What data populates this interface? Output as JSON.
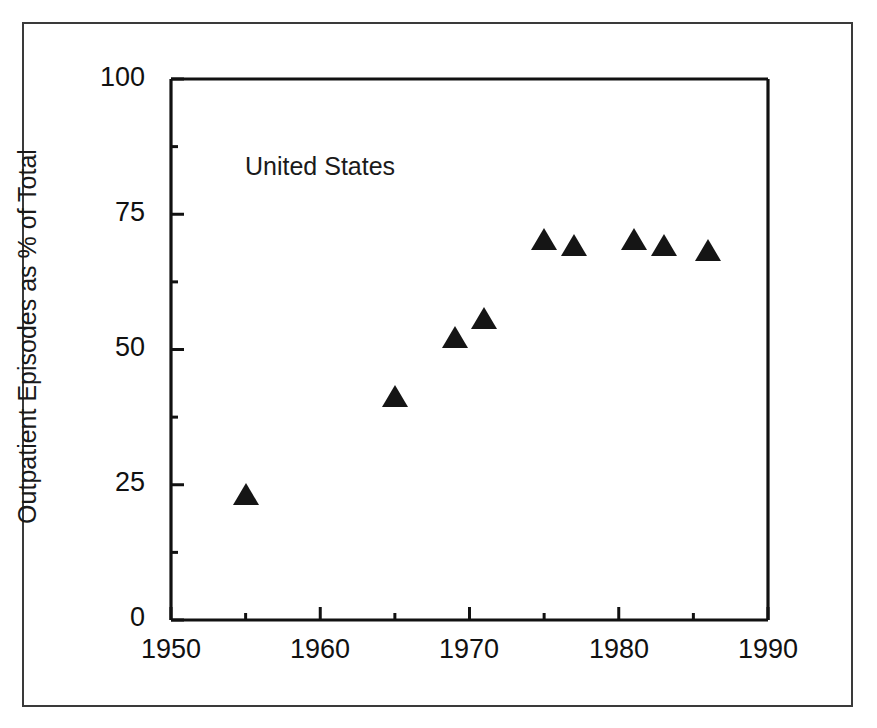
{
  "chart_data": {
    "type": "scatter",
    "title": "",
    "annotation": "United States",
    "xlabel": "",
    "ylabel": "Outpatient Episodes as % of Total",
    "xlim": [
      1950,
      1990
    ],
    "ylim": [
      0,
      100
    ],
    "xticks": [
      1950,
      1960,
      1970,
      1980,
      1990
    ],
    "xtick_labels": [
      "1950",
      "1960",
      "1970",
      "1980",
      "1990"
    ],
    "yticks": [
      0,
      25,
      50,
      75,
      100
    ],
    "ytick_labels": [
      "0",
      "25",
      "50",
      "75",
      "100"
    ],
    "x_minor_tick_interval": 5,
    "y_minor_tick_interval": 12.5,
    "grid": false,
    "legend": false,
    "marker_style": "filled-triangle",
    "marker_color": "#151515",
    "series": [
      {
        "name": "United States",
        "x": [
          1955,
          1965,
          1969,
          1971,
          1975,
          1977,
          1981,
          1983,
          1986
        ],
        "values": [
          23,
          41,
          52,
          55.5,
          70,
          69,
          70,
          69,
          68
        ]
      }
    ]
  },
  "figure": {
    "frame_color": "#3a3a3a",
    "axis_color": "#111111",
    "background": "#ffffff"
  }
}
